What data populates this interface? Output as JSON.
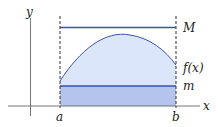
{
  "diagram": {
    "axes": {
      "x_label": "x",
      "y_label": "y"
    },
    "interval": {
      "left": "a",
      "right": "b"
    },
    "lines": {
      "upper_bound": "M",
      "function": "f(x)",
      "lower_bound": "m"
    },
    "colors": {
      "line": "#3a55a8",
      "upper_fill": "#dbe6fa",
      "lower_fill": "#b4c4ec",
      "axis": "#555555",
      "dash": "#333333"
    }
  }
}
